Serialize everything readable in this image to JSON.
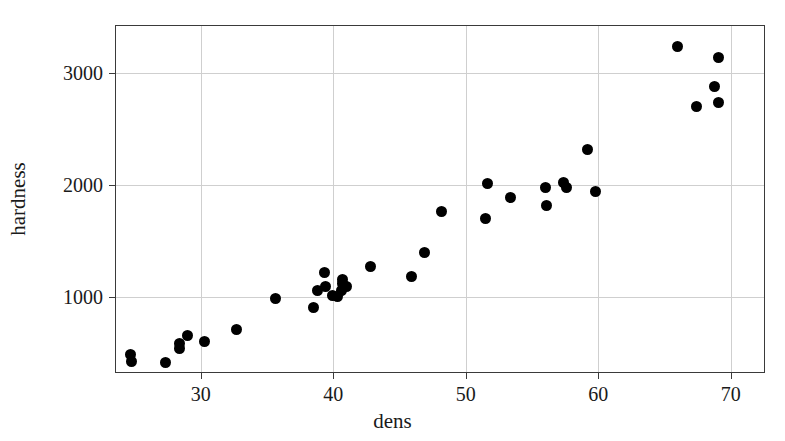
{
  "chart_data": {
    "type": "scatter",
    "title": "",
    "xlabel": "dens",
    "ylabel": "hardness",
    "xlim": [
      23.6,
      72.5
    ],
    "ylim": [
      328,
      3423
    ],
    "grid": true,
    "legend": null,
    "marker": {
      "shape": "circle",
      "color": "#000000",
      "size": 11
    },
    "xticks": [
      30,
      40,
      50,
      60,
      70
    ],
    "xtick_labels": [
      "30",
      "40",
      "50",
      "60",
      "70"
    ],
    "yticks": [
      1000,
      2000,
      3000
    ],
    "ytick_labels": [
      "1000",
      "2000",
      "3000"
    ],
    "points": [
      {
        "x": 24.7,
        "y": 484
      },
      {
        "x": 24.8,
        "y": 420
      },
      {
        "x": 27.3,
        "y": 413
      },
      {
        "x": 28.4,
        "y": 536
      },
      {
        "x": 28.4,
        "y": 579
      },
      {
        "x": 29.0,
        "y": 656
      },
      {
        "x": 30.3,
        "y": 597
      },
      {
        "x": 32.7,
        "y": 706
      },
      {
        "x": 35.6,
        "y": 981
      },
      {
        "x": 38.5,
        "y": 909
      },
      {
        "x": 38.8,
        "y": 1061
      },
      {
        "x": 39.3,
        "y": 1222
      },
      {
        "x": 39.4,
        "y": 1094
      },
      {
        "x": 39.9,
        "y": 1012
      },
      {
        "x": 40.3,
        "y": 1002
      },
      {
        "x": 40.6,
        "y": 1060
      },
      {
        "x": 40.7,
        "y": 1119
      },
      {
        "x": 40.7,
        "y": 1159
      },
      {
        "x": 41.0,
        "y": 1091
      },
      {
        "x": 42.8,
        "y": 1274
      },
      {
        "x": 45.9,
        "y": 1184
      },
      {
        "x": 46.9,
        "y": 1398
      },
      {
        "x": 48.2,
        "y": 1764
      },
      {
        "x": 51.5,
        "y": 1698
      },
      {
        "x": 51.6,
        "y": 2010
      },
      {
        "x": 53.4,
        "y": 1886
      },
      {
        "x": 56.0,
        "y": 1976
      },
      {
        "x": 56.1,
        "y": 1819
      },
      {
        "x": 57.4,
        "y": 2020
      },
      {
        "x": 57.6,
        "y": 1974
      },
      {
        "x": 59.2,
        "y": 2316
      },
      {
        "x": 59.8,
        "y": 1940
      },
      {
        "x": 66.0,
        "y": 3242
      },
      {
        "x": 67.4,
        "y": 2706
      },
      {
        "x": 68.8,
        "y": 2878
      },
      {
        "x": 69.1,
        "y": 3144
      },
      {
        "x": 69.1,
        "y": 2740
      }
    ]
  },
  "axes": {
    "x_title": "dens",
    "y_title": "hardness"
  },
  "colors": {
    "marker": "#000000",
    "frame": "#3a3a3a",
    "grid": "#cfcfcf",
    "background": "#ffffff",
    "text": "#1a1a1a"
  }
}
